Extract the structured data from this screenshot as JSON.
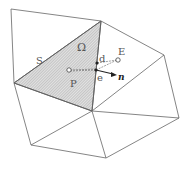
{
  "diagram": {
    "labels": {
      "omega": "Ω",
      "s": "S",
      "p": "P",
      "e_upper": "E",
      "d": "d",
      "e_lower": "e",
      "n": "n"
    },
    "colors": {
      "edge": "#666666",
      "shade": "#d0d0d0",
      "hatch": "#a8a8a8",
      "point": "#222222"
    }
  }
}
